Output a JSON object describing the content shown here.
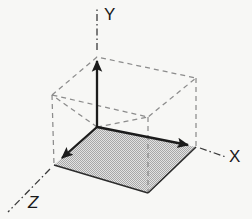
{
  "figure": {
    "type": "diagram",
    "canvas": {
      "width": 252,
      "height": 219,
      "background": "#f7f7f5"
    },
    "style": {
      "line_color": "#262626",
      "hidden_edge_color": "#808080",
      "floor_fill": "#c6c6c6",
      "floor_pattern": "halftone-dither",
      "label_color": "#1a1a1a",
      "solid_line_width": 2.2,
      "dashed_line_width": 1.2,
      "dash_pattern": "5,4",
      "dash_dot_pattern": "7,3,1.5,3"
    },
    "origin": {
      "x": 97,
      "y": 127
    },
    "axes": [
      {
        "name": "y-axis",
        "label": "Y",
        "label_position": {
          "x": 104,
          "y": 6
        },
        "solid_from": {
          "x": 97,
          "y": 127
        },
        "solid_to": {
          "x": 97,
          "y": 62
        },
        "arrow_tip": {
          "x": 97,
          "y": 55
        },
        "extension_from": {
          "x": 97,
          "y": 50
        },
        "extension_to": {
          "x": 97,
          "y": 9
        },
        "direction": "up"
      },
      {
        "name": "x-axis",
        "label": "X",
        "label_position": {
          "x": 229,
          "y": 148
        },
        "solid_from": {
          "x": 97,
          "y": 127
        },
        "solid_to": {
          "x": 186,
          "y": 145
        },
        "arrow_tip": {
          "x": 196,
          "y": 147
        },
        "extension_from": {
          "x": 200,
          "y": 148
        },
        "extension_to": {
          "x": 226,
          "y": 157
        },
        "direction": "right-down"
      },
      {
        "name": "z-axis",
        "label": "Z",
        "label_position": {
          "x": 28,
          "y": 194
        },
        "solid_from": {
          "x": 97,
          "y": 127
        },
        "solid_to": {
          "x": 63,
          "y": 157
        },
        "arrow_tip": {
          "x": 54,
          "y": 165
        },
        "extension_from": {
          "x": 50,
          "y": 169
        },
        "extension_to": {
          "x": 8,
          "y": 212
        },
        "direction": "left-down"
      }
    ],
    "floor": {
      "name": "shaded-floor-face",
      "points": "97,127 196,147 148,193 54,165",
      "fill": "#c6c6c6"
    },
    "box_edges": {
      "top_face": "52,95 97,57 196,78 148,117",
      "vertical_left": {
        "x1": 52,
        "y1": 95,
        "x2": 54,
        "y2": 165
      },
      "vertical_right": {
        "x1": 196,
        "y1": 78,
        "x2": 196,
        "y2": 147
      },
      "vertical_front": {
        "x1": 148,
        "y1": 117,
        "x2": 148,
        "y2": 193
      },
      "inner_left": {
        "x1": 97,
        "y1": 127,
        "x2": 52,
        "y2": 95
      },
      "inner_right": {
        "x1": 97,
        "y1": 127,
        "x2": 148,
        "y2": 117
      }
    }
  }
}
